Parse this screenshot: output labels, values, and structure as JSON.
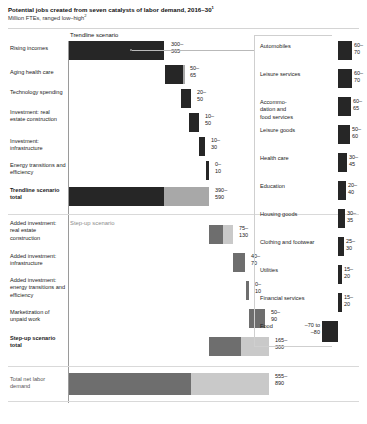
{
  "header": {
    "title": "Potential jobs created from seven catalysts of labor demand, 2016–30",
    "title_sup": "1",
    "subtitle": "Million FTEs, ranged low–high",
    "subtitle_sup": "2"
  },
  "scenarios": {
    "trendline_label": "Trendline scenario",
    "stepup_label": "Step-up scenario"
  },
  "colors": {
    "dark": "#262626",
    "mid": "#6e6e6e",
    "light": "#a8a8a8",
    "pale": "#c9c9c9",
    "axis": "#9a9a9a",
    "rule": "#d4d4d4"
  },
  "chart_data": {
    "type": "bar",
    "title": "Potential jobs created from seven catalysts of labor demand, 2016–30",
    "subtitle": "Million FTEs, ranged low–high",
    "xlabel": "Million FTEs",
    "ylabel": "",
    "grid": false,
    "legend": "none",
    "units": "million FTEs",
    "waterfall": {
      "categories": [
        "Rising incomes",
        "Aging health care",
        "Technology spending",
        "Investment: real estate construction",
        "Investment: infrastructure",
        "Energy transitions and efficiency",
        "Trendline scenario total",
        "Added investment: real estate construction",
        "Added investment: infrastructure",
        "Added investment: energy transitions and efficiency",
        "Marketization of unpaid work",
        "Step-up scenario total",
        "Total net labor demand"
      ],
      "low": [
        300,
        50,
        20,
        10,
        10,
        0,
        390,
        75,
        40,
        0,
        50,
        165,
        555
      ],
      "high": [
        365,
        65,
        50,
        50,
        30,
        10,
        590,
        130,
        70,
        10,
        90,
        300,
        890
      ],
      "labels": [
        "300–\n365",
        "50–\n65",
        "20–\n50",
        "10–\n50",
        "10–\n30",
        "0–\n10",
        "390–\n590",
        "75–\n130",
        "40–\n70",
        "0–\n10",
        "50–\n90",
        "165–\n300",
        "555–\n890"
      ]
    },
    "sectors": {
      "categories": [
        "Automobiles",
        "Leisure services",
        "Accommodation and food services",
        "Leisure goods",
        "Health care",
        "Education",
        "Housing goods",
        "Clothing and footwear",
        "Utilities",
        "Financial services",
        "Food"
      ],
      "low": [
        60,
        60,
        60,
        50,
        30,
        20,
        30,
        25,
        15,
        15,
        -70
      ],
      "high": [
        70,
        70,
        65,
        60,
        45,
        40,
        35,
        30,
        20,
        20,
        -80
      ],
      "labels": [
        "60–\n70",
        "60–\n70",
        "60–\n65",
        "50–\n60",
        "30–\n45",
        "20–\n40",
        "30–\n35",
        "25–\n30",
        "15–\n20",
        "15–\n20",
        "–70 to\n–80"
      ]
    }
  },
  "waterfall_rows": [
    {
      "label": "Rising incomes",
      "value": "300–\n365",
      "bold": false,
      "grey": false,
      "bar_left": 0,
      "bar_width": 95,
      "seg_dark": 95,
      "seg_light": 0,
      "top": 9,
      "height": 19,
      "label_top": 13,
      "val_left": 102
    },
    {
      "label": "Aging health care",
      "value": "50–\n65",
      "bold": false,
      "grey": false,
      "bar_left": 96,
      "bar_width": 20,
      "seg_dark": 18,
      "seg_light": 2,
      "top": 33,
      "height": 19,
      "label_top": 37,
      "val_left": 121
    },
    {
      "label": "Technology spending",
      "value": "20–\n50",
      "bold": false,
      "grey": false,
      "bar_left": 112,
      "bar_width": 10,
      "seg_dark": 10,
      "seg_light": 0,
      "top": 57,
      "height": 19,
      "label_top": 57,
      "val_left": 128
    },
    {
      "label": "Investment: real estate construction",
      "value": "10–\n50",
      "bold": false,
      "grey": false,
      "bar_left": 120,
      "bar_width": 10,
      "seg_dark": 10,
      "seg_light": 0,
      "top": 81,
      "height": 19,
      "label_top": 77,
      "val_left": 136
    },
    {
      "label": "Investment: infrastructure",
      "value": "10–\n30",
      "bold": false,
      "grey": false,
      "bar_left": 130,
      "bar_width": 6,
      "seg_dark": 6,
      "seg_light": 0,
      "top": 105,
      "height": 19,
      "label_top": 106,
      "val_left": 142
    },
    {
      "label": "Energy transitions and efficiency",
      "value": "0–\n10",
      "bold": false,
      "grey": false,
      "bar_left": 137,
      "bar_width": 3,
      "seg_dark": 3,
      "seg_light": 0,
      "top": 129,
      "height": 19,
      "label_top": 130,
      "val_left": 146
    },
    {
      "label": "Trendline scenario total",
      "value": "390–\n590",
      "bold": true,
      "grey": false,
      "bar_left": 0,
      "bar_width": 140,
      "seg_dark": 95,
      "seg_light": 45,
      "top": 155,
      "height": 19,
      "label_top": 155,
      "val_left": 146
    },
    {
      "label": "Added investment: real estate construction",
      "value": "75–\n130",
      "bold": false,
      "grey": false,
      "bar_left": 140,
      "bar_width": 24,
      "seg_dark": 14,
      "seg_light": 10,
      "top": 193,
      "height": 19,
      "label_top": 188,
      "val_left": 170
    },
    {
      "label": "Added investment: infrastructure",
      "value": "40–\n70",
      "bold": false,
      "grey": false,
      "bar_left": 164,
      "bar_width": 12,
      "seg_dark": 12,
      "seg_light": 0,
      "top": 221,
      "height": 19,
      "label_top": 221,
      "val_left": 182
    },
    {
      "label": "Added investment: energy transitions and efficiency",
      "value": "0–\n10",
      "bold": false,
      "grey": false,
      "bar_left": 177,
      "bar_width": 3,
      "seg_dark": 3,
      "seg_light": 0,
      "top": 249,
      "height": 19,
      "label_top": 245,
      "val_left": 186
    },
    {
      "label": "Marketization of unpaid work",
      "value": "50–\n90",
      "bold": false,
      "grey": false,
      "bar_left": 180,
      "bar_width": 16,
      "seg_dark": 16,
      "seg_light": 0,
      "top": 277,
      "height": 19,
      "label_top": 277,
      "val_left": 202
    },
    {
      "label": "Step-up scenario total",
      "value": "165–\n300",
      "bold": true,
      "grey": false,
      "bar_left": 140,
      "bar_width": 60,
      "seg_dark": 32,
      "seg_light": 28,
      "top": 305,
      "height": 19,
      "label_top": 303,
      "val_left": 206
    },
    {
      "label": "Total net labor demand",
      "value": "555–\n890",
      "bold": false,
      "grey": true,
      "bar_left": 0,
      "bar_width": 200,
      "seg_dark": 122,
      "seg_light": 78,
      "top": 341,
      "height": 22,
      "label_top": 344,
      "val_left": 206
    }
  ],
  "sector_rows": [
    {
      "label": "Automobiles",
      "value": "60–\n70",
      "top": 9,
      "bar_w": 14,
      "bar_h": 19,
      "neg": false
    },
    {
      "label": "Leisure services",
      "value": "60–\n70",
      "top": 37,
      "bar_w": 14,
      "bar_h": 19,
      "neg": false
    },
    {
      "label": "Accommo-\ndation and\nfood services",
      "value": "60–\n65",
      "top": 65,
      "bar_w": 13,
      "bar_h": 19,
      "neg": false
    },
    {
      "label": "Leisure goods",
      "value": "50–\n60",
      "top": 93,
      "bar_w": 12,
      "bar_h": 19,
      "neg": false
    },
    {
      "label": "Health care",
      "value": "30–\n45",
      "top": 121,
      "bar_w": 9,
      "bar_h": 19,
      "neg": false
    },
    {
      "label": "Education",
      "value": "20–\n40",
      "top": 149,
      "bar_w": 8,
      "bar_h": 19,
      "neg": false
    },
    {
      "label": "Housing goods",
      "value": "30–\n35",
      "top": 177,
      "bar_w": 7,
      "bar_h": 19,
      "neg": false
    },
    {
      "label": "Clothing and footwear",
      "value": "25–\n30",
      "top": 205,
      "bar_w": 6,
      "bar_h": 19,
      "neg": false
    },
    {
      "label": "Utilities",
      "value": "15–\n20",
      "top": 233,
      "bar_w": 4,
      "bar_h": 19,
      "neg": false
    },
    {
      "label": "Financial services",
      "value": "15–\n20",
      "top": 261,
      "bar_w": 4,
      "bar_h": 19,
      "neg": false
    },
    {
      "label": "Food",
      "value": "–70 to\n–80",
      "top": 289,
      "bar_w": 16,
      "bar_h": 21,
      "neg": true
    }
  ]
}
